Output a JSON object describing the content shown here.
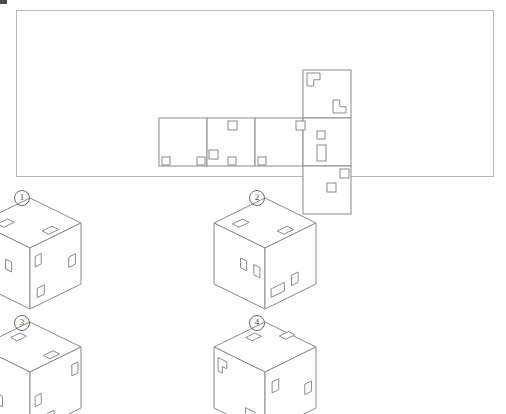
{
  "page": {
    "width": 506,
    "height": 414,
    "background": "#ffffff",
    "line_color": "#8a8a8a",
    "frame_color": "#b8b8b8",
    "hole_color": "#8a8a8a"
  },
  "artifact": {
    "name": "top-left-crop-mark",
    "visible": true
  },
  "net": {
    "frame": {
      "x": 16,
      "y": 10,
      "width": 478,
      "height": 167
    },
    "cell_size": 48,
    "origin": {
      "x": 143,
      "y": 60
    },
    "cells": [
      {
        "id": "A",
        "col": 0,
        "row": 1,
        "label": "left-face"
      },
      {
        "id": "B",
        "col": 1,
        "row": 1,
        "label": "front-face"
      },
      {
        "id": "C",
        "col": 2,
        "row": 1,
        "label": "right-face"
      },
      {
        "id": "D",
        "col": 3,
        "row": 0,
        "label": "top-face"
      },
      {
        "id": "E",
        "col": 3,
        "row": 1,
        "label": "back-face"
      },
      {
        "id": "F",
        "col": 3,
        "row": 2,
        "label": "bottom-face"
      }
    ],
    "marks": {
      "D": [
        {
          "type": "L-notch",
          "corner": "top-left",
          "x": 4,
          "y": 3,
          "w": 13,
          "h": 13
        },
        {
          "type": "L-notch",
          "corner": "bottom-right",
          "x": 30,
          "y": 30,
          "w": 13,
          "h": 13
        }
      ],
      "A": [
        {
          "type": "square",
          "x": 3,
          "y": 39,
          "w": 8,
          "h": 8
        },
        {
          "type": "square",
          "x": 38,
          "y": 39,
          "w": 8,
          "h": 8
        }
      ],
      "B": [
        {
          "type": "square",
          "x": 21,
          "y": 3,
          "w": 9,
          "h": 9
        },
        {
          "type": "square",
          "x": 2,
          "y": 32,
          "w": 9,
          "h": 9
        },
        {
          "type": "square",
          "x": 21,
          "y": 39,
          "w": 8,
          "h": 8
        }
      ],
      "C": [
        {
          "type": "square",
          "x": 41,
          "y": 3,
          "w": 9,
          "h": 9
        },
        {
          "type": "square",
          "x": 3,
          "y": 39,
          "w": 8,
          "h": 8
        }
      ],
      "E": [
        {
          "type": "square",
          "x": 14,
          "y": 13,
          "w": 8,
          "h": 8
        },
        {
          "type": "rect",
          "x": 14,
          "y": 27,
          "w": 9,
          "h": 16
        }
      ],
      "F": [
        {
          "type": "square",
          "x": 37,
          "y": 3,
          "w": 9,
          "h": 9
        },
        {
          "type": "square",
          "x": 24,
          "y": 17,
          "w": 9,
          "h": 9
        }
      ]
    }
  },
  "options": [
    {
      "number": "①",
      "label": "1",
      "name": "option-1",
      "position": {
        "x": 30,
        "y": 198
      },
      "cube": {
        "size": 50,
        "top_face_marks": [
          {
            "type": "rect",
            "u": 0.16,
            "v": 0.2,
            "w": 0.2,
            "h": 0.13
          },
          {
            "type": "rect",
            "u": 0.46,
            "v": 0.78,
            "w": 0.19,
            "h": 0.13
          }
        ],
        "left_face_marks": [
          {
            "type": "rect",
            "u": 0.1,
            "v": 0.14,
            "w": 0.11,
            "h": 0.16
          },
          {
            "type": "rect",
            "u": 0.52,
            "v": 0.38,
            "w": 0.12,
            "h": 0.16
          }
        ],
        "right_face_marks": [
          {
            "type": "rect",
            "u": 0.1,
            "v": 0.18,
            "w": 0.12,
            "h": 0.17
          },
          {
            "type": "rect",
            "u": 0.14,
            "v": 0.72,
            "w": 0.14,
            "h": 0.15
          },
          {
            "type": "rect",
            "u": 0.76,
            "v": 0.46,
            "w": 0.13,
            "h": 0.17
          }
        ]
      }
    },
    {
      "number": "②",
      "label": "2",
      "name": "option-2",
      "position": {
        "x": 265,
        "y": 198
      },
      "cube": {
        "size": 50,
        "top_face_marks": [
          {
            "type": "rect",
            "u": 0.16,
            "v": 0.2,
            "w": 0.2,
            "h": 0.13
          },
          {
            "type": "rect",
            "u": 0.46,
            "v": 0.78,
            "w": 0.19,
            "h": 0.13
          }
        ],
        "left_face_marks": [
          {
            "type": "rect",
            "u": 0.52,
            "v": 0.36,
            "w": 0.12,
            "h": 0.16
          },
          {
            "type": "rect",
            "u": 0.78,
            "v": 0.36,
            "w": 0.12,
            "h": 0.17
          }
        ],
        "right_face_marks": [
          {
            "type": "rect",
            "u": 0.12,
            "v": 0.72,
            "w": 0.26,
            "h": 0.14
          },
          {
            "type": "rect",
            "u": 0.52,
            "v": 0.66,
            "w": 0.13,
            "h": 0.17
          }
        ]
      }
    },
    {
      "number": "③",
      "label": "3",
      "name": "option-3",
      "position": {
        "x": 30,
        "y": 322
      },
      "cube": {
        "size": 50,
        "top_face_marks": [
          {
            "type": "rect",
            "u": 0.5,
            "v": 0.12,
            "w": 0.18,
            "h": 0.13
          },
          {
            "type": "rect",
            "u": 0.46,
            "v": 0.8,
            "w": 0.19,
            "h": 0.13
          }
        ],
        "left_face_marks": [
          {
            "type": "rect",
            "u": 0.12,
            "v": 0.62,
            "w": 0.11,
            "h": 0.17
          },
          {
            "type": "rect",
            "u": 0.34,
            "v": 0.62,
            "w": 0.12,
            "h": 0.17
          }
        ],
        "right_face_marks": [
          {
            "type": "rect",
            "u": 0.1,
            "v": 0.44,
            "w": 0.12,
            "h": 0.17
          },
          {
            "type": "rect",
            "u": 0.34,
            "v": 0.82,
            "w": 0.13,
            "h": 0.16
          },
          {
            "type": "rect",
            "u": 0.82,
            "v": 0.22,
            "w": 0.12,
            "h": 0.18
          }
        ]
      }
    },
    {
      "number": "④",
      "label": "4",
      "name": "option-4",
      "position": {
        "x": 265,
        "y": 322
      },
      "cube": {
        "size": 50,
        "top_face_marks": [
          {
            "type": "rect",
            "u": 0.5,
            "v": 0.12,
            "w": 0.18,
            "h": 0.13
          },
          {
            "type": "rect",
            "u": 0.86,
            "v": 0.42,
            "w": 0.18,
            "h": 0.13
          }
        ],
        "left_face_marks": [
          {
            "type": "L-notch",
            "u": 0.08,
            "v": 0.14,
            "w": 0.17,
            "h": 0.22
          },
          {
            "type": "L-notch",
            "u": 0.62,
            "v": 0.74,
            "w": 0.18,
            "h": 0.22
          }
        ],
        "right_face_marks": [
          {
            "type": "rect",
            "u": 0.14,
            "v": 0.22,
            "w": 0.13,
            "h": 0.18
          },
          {
            "type": "rect",
            "u": 0.12,
            "v": 0.82,
            "w": 0.11,
            "h": 0.15
          },
          {
            "type": "rect",
            "u": 0.78,
            "v": 0.52,
            "w": 0.13,
            "h": 0.17
          }
        ]
      }
    }
  ]
}
